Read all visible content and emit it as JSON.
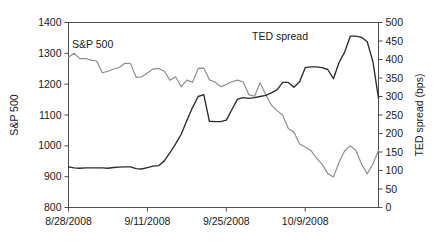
{
  "chart_data": {
    "type": "line",
    "title": "",
    "xlabel": "",
    "ylabel": "S&P 500",
    "y2label": "TED spread (bps)",
    "grid": false,
    "legend": "inline-labels",
    "ylim": [
      800,
      1400
    ],
    "ytick_step": 100,
    "yticks": [
      "800",
      "900",
      "1000",
      "1100",
      "1200",
      "1300",
      "1400"
    ],
    "y2lim": [
      0,
      500
    ],
    "y2tick_step": 50,
    "y2ticks": [
      "0",
      "50",
      "100",
      "150",
      "200",
      "250",
      "300",
      "350",
      "400",
      "450",
      "500"
    ],
    "xticklabels": [
      "8/28/2008",
      "9/11/2008",
      "9/25/2008",
      "10/9/2008"
    ],
    "xtick_indices": [
      0,
      14,
      28,
      42
    ],
    "x_index_count": 56,
    "series": [
      {
        "name": "S&P 500",
        "axis": "left",
        "color": "#8c8c8c",
        "label_text": "S&P 500",
        "values": [
          1287,
          1300,
          1283,
          1283,
          1278,
          1275,
          1237,
          1242,
          1249,
          1254,
          1268,
          1267,
          1222,
          1224,
          1236,
          1249,
          1251,
          1242,
          1213,
          1224,
          1192,
          1213,
          1206,
          1251,
          1252,
          1214,
          1207,
          1192,
          1199,
          1208,
          1213,
          1207,
          1166,
          1161,
          1205,
          1166,
          1132,
          1114,
          1099,
          1056,
          1044,
          1006,
          996,
          985,
          960,
          940,
          910,
          899,
          947,
          984,
          1000,
          985,
          940,
          909,
          940,
          985
        ]
      },
      {
        "name": "TED spread",
        "axis": "right",
        "color": "#2b2b2b",
        "label_text": "TED spread",
        "values": [
          110,
          107,
          106,
          107,
          107,
          107,
          107,
          106,
          108,
          109,
          110,
          110,
          105,
          104,
          108,
          112,
          113,
          126,
          148,
          172,
          198,
          235,
          270,
          300,
          305,
          233,
          232,
          232,
          236,
          265,
          293,
          297,
          295,
          297,
          300,
          303,
          310,
          318,
          338,
          338,
          325,
          340,
          378,
          380,
          380,
          378,
          373,
          348,
          392,
          420,
          463,
          463,
          460,
          448,
          395,
          295
        ]
      }
    ]
  },
  "labels": {
    "y_axis_title": "S&P 500",
    "y2_axis_title": "TED spread (bps)",
    "sp_inline_label": "S&P 500",
    "ted_inline_label": "TED spread"
  },
  "colors": {
    "sp_line": "#8c8c8c",
    "ted_line": "#2b2b2b",
    "axis": "#4d4d4d",
    "text": "#1a1a1a",
    "background": "#ffffff"
  }
}
